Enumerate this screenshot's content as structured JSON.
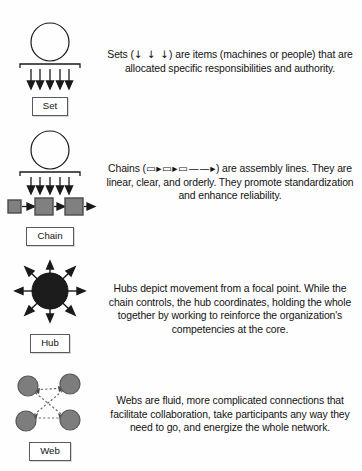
{
  "diagram": {
    "colors": {
      "stroke": "#1a1a1a",
      "box_fill": "#808080",
      "box_stroke": "#4a4a4a",
      "hub_fill": "#1c1c1c",
      "web_node_fill": "#7d7d7d",
      "web_node_stroke": "#5a5a5a",
      "label_border": "#5a5a5a",
      "background": "#ffffff"
    },
    "rows": [
      {
        "key": "set",
        "label": "Set",
        "icon": "circle-bracket-arrows-icon",
        "arrow_count": 5,
        "description_parts": {
          "lead": "Sets (",
          "symbol": "↓ ↓ ↓",
          "rest": ") are items (machines or people) that are allocated specific responsibilities and authority."
        },
        "description": "Sets (↓ ↓ ↓) are items (machines or people) that are allocated specific responsibilities and authority."
      },
      {
        "key": "chain",
        "label": "Chain",
        "icon": "circle-bracket-arrows-boxes-icon",
        "arrow_count": 5,
        "box_count": 3,
        "description_parts": {
          "lead": "Chains (",
          "symbol": "▭▸▭▸▭——▸",
          "rest": ") are assembly lines. They are linear, clear, and orderly. They promote standardization and enhance reliability."
        },
        "description": "Chains (▭▸▭▸▭——▸) are assembly lines. They are linear, clear, and orderly. They promote standardization and enhance reliability."
      },
      {
        "key": "hub",
        "label": "Hub",
        "icon": "radiating-hub-icon",
        "spoke_count": 8,
        "description": "Hubs depict movement from a focal point. While the chain controls, the hub coordinates, holding the whole together by working to reinforce the organization's competencies at the core."
      },
      {
        "key": "web",
        "label": "Web",
        "icon": "web-network-icon",
        "node_count": 4,
        "description": "Webs are fluid, more complicated connections that facilitate collaboration, take participants any way they need to go, and energize the whole network."
      }
    ]
  }
}
